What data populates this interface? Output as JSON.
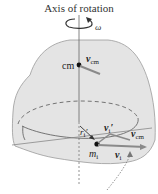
{
  "diagram": {
    "title": "Axis of rotation",
    "angular_velocity_symbol": "ω",
    "center_of_mass_label": "cm",
    "vectors": {
      "v_cm_top": {
        "symbol": "v",
        "subscript": "cm"
      },
      "v_cm_bottom": {
        "symbol": "v",
        "subscript": "cm"
      },
      "r_i_prime": {
        "symbol": "r",
        "subscript": "i",
        "prime": "′"
      },
      "v_i_prime": {
        "symbol": "v",
        "subscript": "i",
        "prime": "′"
      },
      "v_i": {
        "symbol": "v",
        "subscript": "i"
      }
    },
    "particle_label": {
      "symbol": "m",
      "subscript": "i"
    },
    "colors": {
      "body_fill": "#e4e4e4",
      "body_outline": "#9a9a9a",
      "axis": "#555555",
      "vector_gray": "#8a8a8a",
      "dot": "#111111"
    }
  }
}
